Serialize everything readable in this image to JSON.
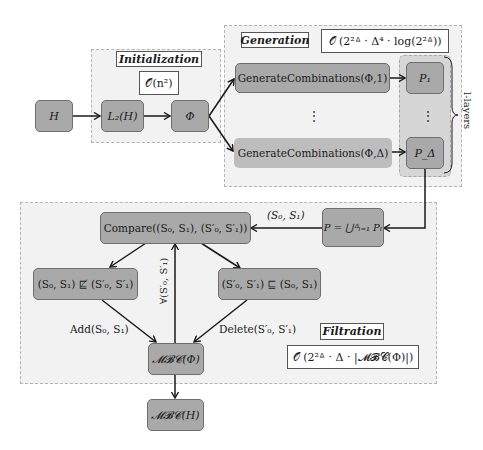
{
  "diagram": {
    "regions": {
      "initialization": {
        "title": "Initialization",
        "complexity": "𝒪(n²)"
      },
      "generation": {
        "title": "Generation",
        "complexity": "𝒪 (2²ᐞ · Δ⁴ · log(2²ᐞ))",
        "layers_label": "l-layers",
        "vdots": "⋮"
      },
      "filtration": {
        "title": "Filtration",
        "complexity": "𝒪 (2²ᐞ · Δ · |𝓜𝓑𝓒(Φ)|)"
      }
    },
    "nodes": {
      "h": "H",
      "l2h": "L₂(H)",
      "phi": "Φ",
      "gen1": "GenerateCombinations(Φ,1)",
      "gendelta": "GenerateCombinations(Φ,Δ)",
      "p1": "P₁",
      "pdelta": "P_Δ",
      "punion": "P = ⋃ᐞₗ₌₁ Pₗ",
      "compare": "Compare((S₀, S₁), (S′₀, S′₁))",
      "not_subsumed": "(S₀, S₁) ⋢ (S′₀, S′₁)",
      "subsumed": "(S′₀, S′₁) ⊑ (S₀, S₁)",
      "mbc_phi": "𝓜𝓑𝓒(Φ)",
      "mbc_h": "𝓜𝓑𝓒(H)"
    },
    "edge_labels": {
      "pair": "(S₀, S₁)",
      "forall": "∀(S′₀, S′₁)",
      "add": "Add(S₀, S₁)",
      "delete": "Delete(S′₀, S′₁)"
    },
    "colors": {
      "node_fill": "#a9a9a9",
      "node_border": "#6e6e6e",
      "region_fill": "#f2f2f2",
      "region_border": "#b4b4b4",
      "edge": "#1a1a1a"
    }
  }
}
